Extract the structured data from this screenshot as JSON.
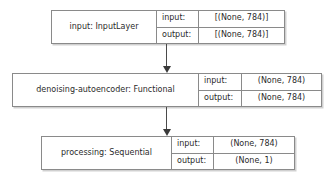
{
  "diagram": {
    "type": "keras-model-graph",
    "orientation": "top-to-bottom",
    "background_color": "#ffffff",
    "border_color": "#8a8a8a",
    "text_color": "#2b2b2b",
    "arrow_color": "#3a3a3a"
  },
  "nodes": [
    {
      "id": "input",
      "name": "input: InputLayer",
      "io": {
        "input_label": "input:",
        "input_value": "[(None, 784)]",
        "output_label": "output:",
        "output_value": "[(None, 784)]"
      }
    },
    {
      "id": "autoencoder",
      "name": "denoising-autoencoder: Functional",
      "io": {
        "input_label": "input:",
        "input_value": "(None, 784)",
        "output_label": "output:",
        "output_value": "(None, 784)"
      }
    },
    {
      "id": "processing",
      "name": "processing: Sequential",
      "io": {
        "input_label": "input:",
        "input_value": "(None, 784)",
        "output_label": "output:",
        "output_value": "(None, 1)"
      }
    }
  ],
  "edges": [
    {
      "id": "edge-1",
      "from": "input",
      "to": "autoencoder",
      "icon": "down-arrow-icon"
    },
    {
      "id": "edge-2",
      "from": "autoencoder",
      "to": "processing",
      "icon": "down-arrow-icon"
    }
  ]
}
